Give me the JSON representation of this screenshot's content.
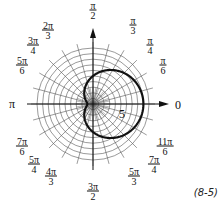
{
  "figure_label": "(8-5)",
  "ring_label": "5",
  "polar": {
    "center": [
      93,
      104
    ],
    "ring_count": 10,
    "ring_spacing_px": 5.6,
    "curve": {
      "equation": "r = 5 + 4cos(θ)",
      "a": 5,
      "b": 4
    },
    "curve_color": "#111111",
    "grid_color": "#555555"
  },
  "angle_labels": [
    {
      "num": "π",
      "den": "2",
      "x": 93,
      "y": 10
    },
    {
      "num": "π",
      "den": "3",
      "x": 133,
      "y": 25
    },
    {
      "num": "π",
      "den": "4",
      "x": 150,
      "y": 45
    },
    {
      "num": "π",
      "den": "6",
      "x": 163,
      "y": 65
    },
    {
      "single": "0",
      "x": 178,
      "y": 105
    },
    {
      "num": "11π",
      "den": "6",
      "x": 165,
      "y": 146
    },
    {
      "num": "7π",
      "den": "4",
      "x": 154,
      "y": 164
    },
    {
      "num": "5π",
      "den": "3",
      "x": 134,
      "y": 176
    },
    {
      "num": "3π",
      "den": "2",
      "x": 93,
      "y": 191
    },
    {
      "num": "4π",
      "den": "3",
      "x": 51,
      "y": 176
    },
    {
      "num": "5π",
      "den": "4",
      "x": 34,
      "y": 164
    },
    {
      "num": "7π",
      "den": "6",
      "x": 22,
      "y": 146
    },
    {
      "single": "π",
      "x": 12,
      "y": 104
    },
    {
      "num": "5π",
      "den": "6",
      "x": 22,
      "y": 65
    },
    {
      "num": "3π",
      "den": "4",
      "x": 33,
      "y": 45
    },
    {
      "num": "2π",
      "den": "3",
      "x": 48,
      "y": 30
    }
  ]
}
